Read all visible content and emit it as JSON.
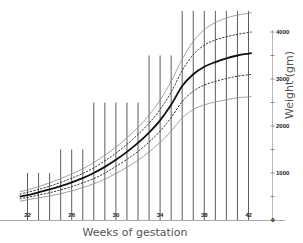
{
  "chart_data": {
    "type": "line",
    "title": "",
    "xlabel": "Weeks of gestation",
    "ylabel": "Weight (gm)",
    "xlim": [
      21.3,
      43
    ],
    "ylim": [
      0,
      4400
    ],
    "x_ticks": [
      22,
      26,
      30,
      34,
      38,
      42
    ],
    "x_tick_labels": [
      "22",
      "26",
      "30",
      "34",
      "38",
      "42"
    ],
    "y_ticks": [
      0,
      500,
      1000,
      1500,
      2000,
      2500,
      3000,
      3500,
      4000
    ],
    "y_tick_labels": [
      "0",
      "",
      "1000",
      "",
      "2000",
      "",
      "3000",
      "",
      "4000"
    ],
    "y_axis_position": "right",
    "legend": [],
    "grid": "vertical lines at each week, heights stepped",
    "x": [
      21.3,
      22,
      23,
      24,
      25,
      26,
      27,
      28,
      29,
      30,
      31,
      32,
      33,
      34,
      35,
      36,
      37,
      38,
      39,
      40,
      41,
      42,
      42.3
    ],
    "series": [
      {
        "name": "upper outer",
        "style": "thin-gray",
        "values": [
          600,
          640,
          710,
          790,
          880,
          980,
          1090,
          1220,
          1380,
          1550,
          1750,
          1970,
          2230,
          2550,
          2950,
          3420,
          3800,
          4050,
          4200,
          4300,
          4360,
          4400,
          4410
        ]
      },
      {
        "name": "upper dashed",
        "style": "dashed",
        "values": [
          550,
          590,
          650,
          720,
          800,
          890,
          990,
          1110,
          1260,
          1420,
          1610,
          1820,
          2060,
          2350,
          2720,
          3180,
          3520,
          3720,
          3830,
          3900,
          3950,
          3990,
          4000
        ]
      },
      {
        "name": "median",
        "style": "thick-solid",
        "values": [
          500,
          530,
          590,
          650,
          720,
          800,
          890,
          1000,
          1130,
          1280,
          1450,
          1640,
          1860,
          2120,
          2450,
          2850,
          3100,
          3260,
          3360,
          3440,
          3500,
          3540,
          3550
        ]
      },
      {
        "name": "lower dashed",
        "style": "dashed",
        "values": [
          450,
          480,
          530,
          580,
          640,
          710,
          790,
          880,
          1000,
          1140,
          1290,
          1460,
          1660,
          1890,
          2180,
          2520,
          2740,
          2870,
          2950,
          3010,
          3060,
          3090,
          3100
        ]
      },
      {
        "name": "lower outer",
        "style": "thin-gray",
        "values": [
          400,
          430,
          470,
          510,
          560,
          620,
          690,
          770,
          870,
          990,
          1120,
          1270,
          1450,
          1650,
          1890,
          2170,
          2350,
          2450,
          2510,
          2560,
          2600,
          2620,
          2630
        ]
      }
    ],
    "vertical_lines": {
      "weeks": [
        22,
        23,
        24,
        25,
        26,
        27,
        28,
        29,
        30,
        31,
        32,
        33,
        34,
        35,
        36,
        37,
        38,
        39,
        40,
        41,
        42
      ],
      "top_values": [
        1000,
        1000,
        1000,
        1500,
        1500,
        1500,
        2500,
        2500,
        2500,
        2500,
        2500,
        3500,
        3500,
        3500,
        4450,
        4450,
        4450,
        4450,
        4450,
        4450,
        4450
      ]
    }
  }
}
